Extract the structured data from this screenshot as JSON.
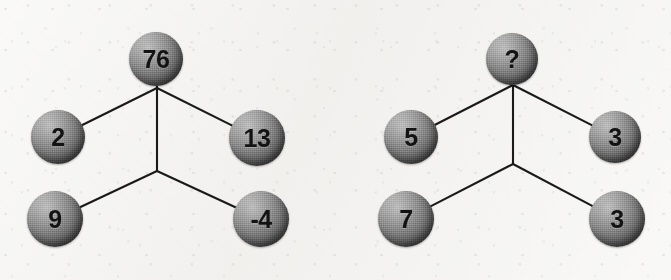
{
  "page": {
    "background_color": "#f3f2f0",
    "node_fill_color": "#6f6f6f",
    "node_text_color": "#131313",
    "edge_color": "#1a1a1a"
  },
  "diagrams": [
    {
      "name": "left-diagram",
      "nodes": [
        {
          "id": "left-top",
          "role": "apex",
          "value": "76",
          "cx": 156,
          "cy": 59,
          "r": 27,
          "font_size": 25
        },
        {
          "id": "left-upper-left",
          "role": "upper-left",
          "value": "2",
          "cx": 58,
          "cy": 137,
          "r": 27,
          "font_size": 25
        },
        {
          "id": "left-upper-right",
          "role": "upper-right",
          "value": "13",
          "cx": 257,
          "cy": 138,
          "r": 28,
          "font_size": 25
        },
        {
          "id": "left-lower-left",
          "role": "lower-left",
          "value": "9",
          "cx": 55,
          "cy": 219,
          "r": 28,
          "font_size": 25
        },
        {
          "id": "left-lower-right",
          "role": "lower-right",
          "value": "-4",
          "cx": 261,
          "cy": 219,
          "r": 28,
          "font_size": 25
        }
      ],
      "junctions": [
        {
          "id": "left-upper-junction",
          "x": 157,
          "y": 88
        },
        {
          "id": "left-lower-junction",
          "x": 157,
          "y": 171
        }
      ],
      "edges": [
        {
          "id": "left-edge-apex-to-upper-junction",
          "from": "left-top",
          "to": "left-upper-junction"
        },
        {
          "id": "left-edge-junction-to-upper-left",
          "from": "left-upper-junction",
          "to": "left-upper-left"
        },
        {
          "id": "left-edge-junction-to-upper-right",
          "from": "left-upper-junction",
          "to": "left-upper-right"
        },
        {
          "id": "left-edge-junction-to-junction",
          "from": "left-upper-junction",
          "to": "left-lower-junction"
        },
        {
          "id": "left-edge-junction-to-lower-left",
          "from": "left-lower-junction",
          "to": "left-lower-left"
        },
        {
          "id": "left-edge-junction-to-lower-right",
          "from": "left-lower-junction",
          "to": "left-lower-right"
        }
      ]
    },
    {
      "name": "right-diagram",
      "nodes": [
        {
          "id": "right-top",
          "role": "apex",
          "value": "?",
          "cx": 512,
          "cy": 59,
          "r": 26,
          "font_size": 25
        },
        {
          "id": "right-upper-left",
          "role": "upper-left",
          "value": "5",
          "cx": 411,
          "cy": 137,
          "r": 27,
          "font_size": 25
        },
        {
          "id": "right-upper-right",
          "role": "upper-right",
          "value": "3",
          "cx": 615,
          "cy": 137,
          "r": 26,
          "font_size": 25
        },
        {
          "id": "right-lower-left",
          "role": "lower-left",
          "value": "7",
          "cx": 406,
          "cy": 219,
          "r": 28,
          "font_size": 25
        },
        {
          "id": "right-lower-right",
          "role": "lower-right",
          "value": "3",
          "cx": 617,
          "cy": 219,
          "r": 28,
          "font_size": 25
        }
      ],
      "junctions": [
        {
          "id": "right-upper-junction",
          "x": 513,
          "y": 85
        },
        {
          "id": "right-lower-junction",
          "x": 513,
          "y": 164
        }
      ],
      "edges": [
        {
          "id": "right-edge-apex-to-upper-junction",
          "from": "right-top",
          "to": "right-upper-junction"
        },
        {
          "id": "right-edge-junction-to-upper-left",
          "from": "right-upper-junction",
          "to": "right-upper-left"
        },
        {
          "id": "right-edge-junction-to-upper-right",
          "from": "right-upper-junction",
          "to": "right-upper-right"
        },
        {
          "id": "right-edge-junction-to-junction",
          "from": "right-upper-junction",
          "to": "right-lower-junction"
        },
        {
          "id": "right-edge-junction-to-lower-left",
          "from": "right-lower-junction",
          "to": "right-lower-left"
        },
        {
          "id": "right-edge-junction-to-lower-right",
          "from": "right-lower-junction",
          "to": "right-lower-right"
        }
      ]
    }
  ]
}
